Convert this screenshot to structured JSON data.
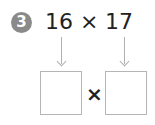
{
  "problem": {
    "number": "3",
    "factor_a": "16",
    "operator": "×",
    "factor_b": "17"
  },
  "answer_row": {
    "box_left_value": "",
    "operator": "×",
    "box_right_value": ""
  },
  "colors": {
    "badge": "#8a8a8a",
    "text": "#222222",
    "lines": "#b0b0b0"
  }
}
